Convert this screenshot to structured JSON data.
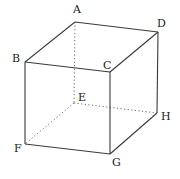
{
  "diagram": {
    "type": "cube",
    "stroke_color": "#3a3a3a",
    "vertices": {
      "A": {
        "label": "A",
        "x": 75,
        "y": 22,
        "lx": 73,
        "ly": 13
      },
      "D": {
        "label": "D",
        "x": 158,
        "y": 32,
        "lx": 157,
        "ly": 27
      },
      "B": {
        "label": "B",
        "x": 25,
        "y": 62,
        "lx": 12,
        "ly": 62
      },
      "C": {
        "label": "C",
        "x": 110,
        "y": 72,
        "lx": 103,
        "ly": 69
      },
      "E": {
        "label": "E",
        "x": 74,
        "y": 103,
        "lx": 78,
        "ly": 101
      },
      "H": {
        "label": "H",
        "x": 157,
        "y": 113,
        "lx": 161,
        "ly": 120
      },
      "F": {
        "label": "F",
        "x": 25,
        "y": 144,
        "lx": 14,
        "ly": 152
      },
      "G": {
        "label": "G",
        "x": 110,
        "y": 154,
        "lx": 112,
        "ly": 166
      }
    },
    "visible_edges": [
      [
        "A",
        "D"
      ],
      [
        "A",
        "B"
      ],
      [
        "B",
        "C"
      ],
      [
        "C",
        "D"
      ],
      [
        "B",
        "F"
      ],
      [
        "C",
        "G"
      ],
      [
        "D",
        "H"
      ],
      [
        "F",
        "G"
      ],
      [
        "G",
        "H"
      ]
    ],
    "hidden_edges": [
      [
        "A",
        "E"
      ],
      [
        "E",
        "F"
      ],
      [
        "E",
        "H"
      ]
    ]
  }
}
